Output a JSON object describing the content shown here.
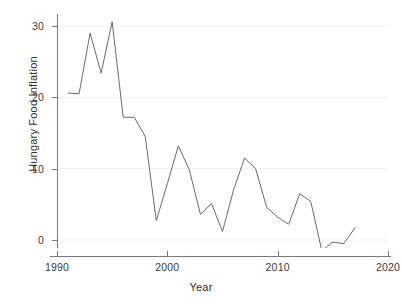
{
  "chart_data": {
    "type": "line",
    "title": "",
    "xlabel": "Year",
    "ylabel": "Hungary Food Inflation",
    "xlim": [
      1990,
      2020
    ],
    "ylim": [
      -3,
      32
    ],
    "xticks": [
      1990,
      2000,
      2010,
      2020
    ],
    "yticks": [
      0,
      10,
      20,
      30
    ],
    "grid": true,
    "grid_axis": "y",
    "legend": false,
    "line_color": "#6b6b6b",
    "grid_color": "#f2f2f2",
    "axis_color": "#7a7a7a",
    "background": "#ffffff",
    "series": [
      {
        "name": "Hungary Food Inflation",
        "x": [
          1991,
          1992,
          1993,
          1994,
          1995,
          1996,
          1997,
          1998,
          1999,
          2000,
          2001,
          2002,
          2003,
          2004,
          2005,
          2006,
          2007,
          2008,
          2009,
          2010,
          2011,
          2012,
          2013,
          2014,
          2015,
          2016,
          2017
        ],
        "values": [
          20.6,
          20.5,
          29.0,
          23.4,
          30.6,
          17.2,
          17.2,
          14.5,
          2.7,
          7.9,
          13.2,
          9.8,
          3.6,
          5.1,
          1.2,
          7.0,
          11.5,
          10.0,
          4.6,
          3.2,
          2.2,
          6.5,
          5.4,
          -1.5,
          -0.3,
          -0.5,
          1.7
        ]
      }
    ]
  },
  "axes": {
    "y_title": "Hungary Food Inflation",
    "x_title": "Year",
    "y_tick_labels": [
      "30",
      "20",
      "10",
      "0"
    ],
    "x_tick_labels": [
      "1990",
      "2000",
      "2010",
      "2020"
    ]
  }
}
